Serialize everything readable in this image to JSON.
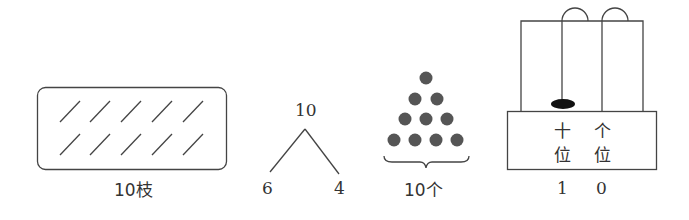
{
  "figures": [
    {
      "id": "sticks",
      "label": "10枝",
      "stick_count": 10,
      "rows": 2,
      "per_row": 5
    },
    {
      "id": "number-bond",
      "whole": "10",
      "left_part": "6",
      "right_part": "4"
    },
    {
      "id": "dots",
      "label": "10个",
      "dot_count": 10,
      "rows": [
        1,
        2,
        3,
        4
      ],
      "dot_color": "#555555"
    },
    {
      "id": "abacus",
      "tens_label_line1": "十",
      "tens_label_line2": "位",
      "ones_label_line1": "个",
      "ones_label_line2": "位",
      "tens_digit": "1",
      "ones_digit": "0",
      "tens_beads": 1,
      "ones_beads": 0
    }
  ]
}
